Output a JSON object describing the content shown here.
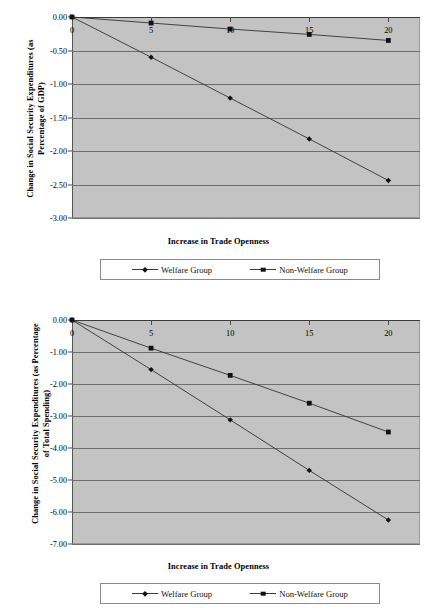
{
  "page": {
    "background": "#ffffff",
    "plot_background": "#c3c3c3",
    "series_color": "#333333",
    "marker_color": "#111111"
  },
  "charts": [
    {
      "id": "top",
      "ylabel": "Change in Social Security Expenditures (as\nPercentage of GDP)",
      "xlabel": "Increase in Trade Openness",
      "yticks": [
        "0.00",
        "-0.50",
        "-1.00",
        "-1.50",
        "-2.00",
        "-2.50",
        "-3.00"
      ],
      "xticks": [
        "0",
        "5",
        "10",
        "15",
        "20"
      ],
      "legend": [
        {
          "label": "Welfare Group",
          "marker": "diamond"
        },
        {
          "label": "Non-Welfare Group",
          "marker": "square"
        }
      ]
    },
    {
      "id": "bottom",
      "ylabel": "Change in Social Security Expenditures (as Percentage\nof Total Spending)",
      "xlabel": "Increase in Trade Openness",
      "yticks": [
        "0.00",
        "-1.00",
        "-2.00",
        "-3.00",
        "-4.00",
        "-5.00",
        "-6.00",
        "-7.00"
      ],
      "xticks": [
        "0",
        "5",
        "10",
        "15",
        "20"
      ],
      "legend": [
        {
          "label": "Welfare Group",
          "marker": "diamond"
        },
        {
          "label": "Non-Welfare Group",
          "marker": "square"
        }
      ]
    }
  ],
  "bottom_caption": "",
  "chart_data": [
    {
      "type": "line",
      "title": "",
      "xlabel": "Increase in Trade Openness",
      "ylabel": "Change in Social Security Expenditures (as Percentage of GDP)",
      "x": [
        0,
        5,
        10,
        15,
        20
      ],
      "xlim": [
        0,
        22
      ],
      "ylim": [
        -3.0,
        0.0
      ],
      "yticks": [
        0.0,
        -0.5,
        -1.0,
        -1.5,
        -2.0,
        -2.5,
        -3.0
      ],
      "grid": true,
      "legend_position": "below",
      "series": [
        {
          "name": "Welfare Group",
          "marker": "diamond",
          "values": [
            0.0,
            -0.6,
            -1.21,
            -1.82,
            -2.44
          ]
        },
        {
          "name": "Non-Welfare Group",
          "marker": "square",
          "values": [
            0.0,
            -0.09,
            -0.18,
            -0.26,
            -0.35
          ]
        }
      ]
    },
    {
      "type": "line",
      "title": "",
      "xlabel": "Increase in Trade Openness",
      "ylabel": "Change in Social Security Expenditures (as Percentage of Total Spending)",
      "x": [
        0,
        5,
        10,
        15,
        20
      ],
      "xlim": [
        0,
        22
      ],
      "ylim": [
        -7.0,
        0.0
      ],
      "yticks": [
        0.0,
        -1.0,
        -2.0,
        -3.0,
        -4.0,
        -5.0,
        -6.0,
        -7.0
      ],
      "grid": true,
      "legend_position": "below",
      "series": [
        {
          "name": "Welfare Group",
          "marker": "diamond",
          "values": [
            0.0,
            -1.55,
            -3.12,
            -4.7,
            -6.25
          ]
        },
        {
          "name": "Non-Welfare Group",
          "marker": "square",
          "values": [
            0.0,
            -0.88,
            -1.73,
            -2.6,
            -3.5
          ]
        }
      ]
    }
  ]
}
